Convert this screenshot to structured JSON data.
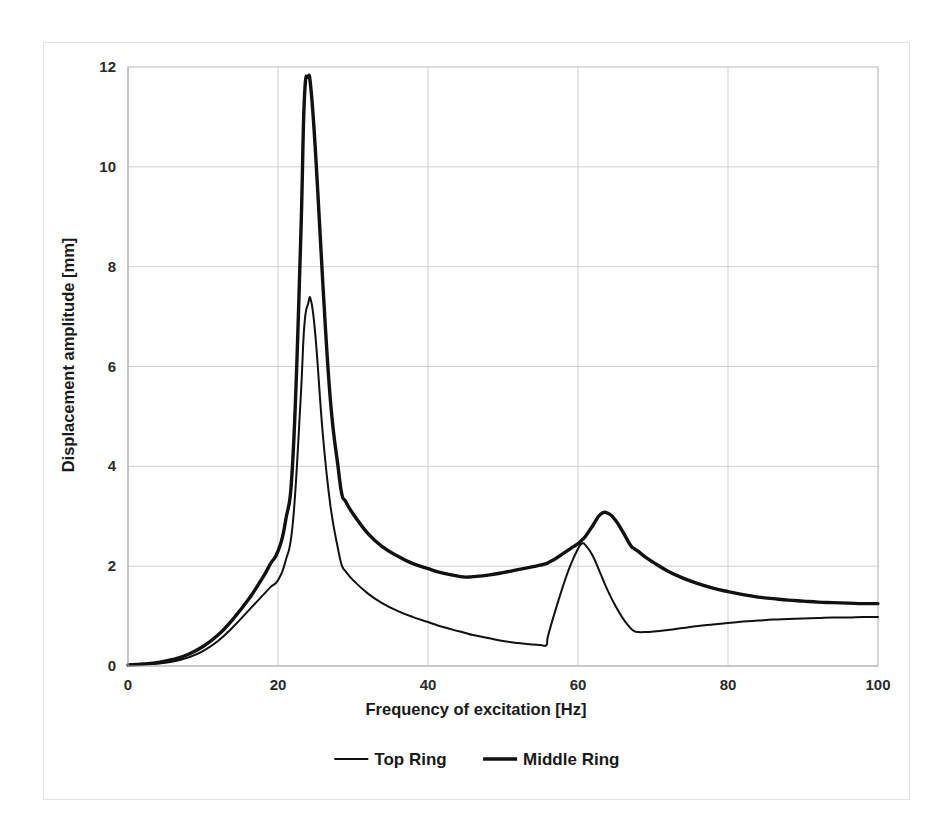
{
  "chart_data": {
    "type": "line",
    "title": "",
    "xlabel": "Frequency of excitation [Hz]",
    "ylabel": "Displacement amplitude [mm]",
    "xlim": [
      0,
      100
    ],
    "ylim": [
      0,
      12
    ],
    "xticks": [
      0,
      20,
      40,
      60,
      80,
      100
    ],
    "yticks": [
      0,
      2,
      4,
      6,
      8,
      10,
      12
    ],
    "grid": true,
    "legend_position": "bottom",
    "x": [
      0,
      2,
      4,
      6,
      8,
      10,
      12,
      14,
      16,
      18,
      19,
      20,
      21,
      22,
      23,
      23.5,
      24,
      24.4,
      25,
      26,
      27,
      28,
      28.5,
      29,
      30,
      32,
      34,
      36,
      38,
      40,
      42,
      44,
      45,
      46,
      48,
      50,
      52,
      54,
      55,
      55.8,
      56,
      57,
      58,
      59,
      60,
      60.5,
      61,
      62,
      63,
      64,
      65,
      66,
      67,
      67.5,
      68,
      69,
      70,
      72,
      74,
      76,
      78,
      80,
      82,
      84,
      86,
      88,
      90,
      92,
      94,
      96,
      98,
      100
    ],
    "series": [
      {
        "name": "Top Ring",
        "line_width": 2.0,
        "color": "#111111",
        "values": [
          0.02,
          0.03,
          0.05,
          0.09,
          0.17,
          0.3,
          0.5,
          0.78,
          1.1,
          1.42,
          1.58,
          1.72,
          2.1,
          2.9,
          5.3,
          6.8,
          7.25,
          7.32,
          6.6,
          4.6,
          3.2,
          2.35,
          2.02,
          1.9,
          1.72,
          1.45,
          1.25,
          1.1,
          0.98,
          0.88,
          0.78,
          0.7,
          0.66,
          0.62,
          0.56,
          0.5,
          0.46,
          0.43,
          0.42,
          0.42,
          0.6,
          1.12,
          1.6,
          2.02,
          2.35,
          2.45,
          2.42,
          2.2,
          1.85,
          1.5,
          1.2,
          0.95,
          0.76,
          0.7,
          0.68,
          0.68,
          0.69,
          0.72,
          0.76,
          0.8,
          0.83,
          0.86,
          0.89,
          0.91,
          0.93,
          0.94,
          0.95,
          0.96,
          0.97,
          0.97,
          0.98,
          0.98
        ]
      },
      {
        "name": "Middle Ring",
        "line_width": 3.4,
        "color": "#111111",
        "values": [
          0.02,
          0.04,
          0.07,
          0.13,
          0.23,
          0.39,
          0.62,
          0.94,
          1.32,
          1.78,
          2.05,
          2.3,
          2.9,
          4.2,
          8.4,
          11.3,
          11.8,
          11.55,
          10.3,
          7.6,
          5.3,
          4.0,
          3.45,
          3.3,
          3.05,
          2.65,
          2.38,
          2.2,
          2.05,
          1.95,
          1.86,
          1.8,
          1.78,
          1.79,
          1.82,
          1.87,
          1.93,
          1.99,
          2.02,
          2.05,
          2.07,
          2.15,
          2.25,
          2.35,
          2.45,
          2.52,
          2.6,
          2.82,
          3.04,
          3.06,
          2.92,
          2.68,
          2.42,
          2.35,
          2.3,
          2.18,
          2.08,
          1.9,
          1.76,
          1.65,
          1.56,
          1.49,
          1.43,
          1.38,
          1.35,
          1.32,
          1.3,
          1.28,
          1.27,
          1.26,
          1.25,
          1.25
        ]
      }
    ]
  },
  "legend": {
    "items": [
      {
        "label": "Top Ring"
      },
      {
        "label": "Middle Ring"
      }
    ]
  }
}
